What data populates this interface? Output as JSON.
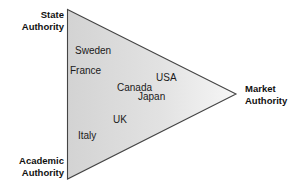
{
  "diagram": {
    "shape": "triangle",
    "fill_left_color": "#d5d5d5",
    "fill_right_color": "#f2f2f2",
    "outline_color": "#3a3a3a",
    "background_color": "#ffffff",
    "corners": [
      {
        "id": "state",
        "line1": "State",
        "line2": "Authority",
        "position": "top-left"
      },
      {
        "id": "academic",
        "line1": "Academic",
        "line2": "Authority",
        "position": "bottom-left"
      },
      {
        "id": "market",
        "line1": "Market",
        "line2": "Authority",
        "position": "right"
      }
    ],
    "countries": [
      {
        "id": "sweden",
        "label": "Sweden"
      },
      {
        "id": "france",
        "label": "France"
      },
      {
        "id": "usa",
        "label": "USA"
      },
      {
        "id": "canada",
        "label": "Canada"
      },
      {
        "id": "japan",
        "label": "Japan"
      },
      {
        "id": "uk",
        "label": "UK"
      },
      {
        "id": "italy",
        "label": "Italy"
      }
    ]
  }
}
